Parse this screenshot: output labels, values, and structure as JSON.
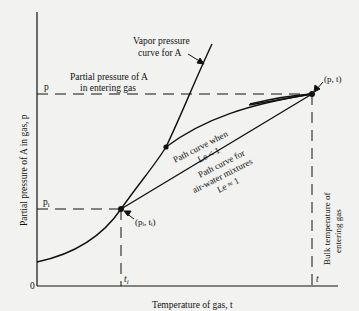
{
  "diagram": {
    "axes": {
      "x_label": "Temperature of gas, t",
      "y_label": "Partial pressure of A in gas, p",
      "origin_label": "0",
      "x_ticks": [
        {
          "label": "t",
          "sub": "i",
          "x": 121
        },
        {
          "label": "t",
          "sub": "",
          "x": 312
        }
      ],
      "y_ticks": [
        {
          "label": "p",
          "sub": "",
          "y": 94
        },
        {
          "label": "p",
          "sub": "i",
          "y": 209
        }
      ]
    },
    "labels": {
      "vapor_curve_line1": "Vapor pressure",
      "vapor_curve_line2": "curve for A",
      "partial_pressure_line1": "Partial pressure of A",
      "partial_pressure_line2": "in entering gas",
      "path_le_lt1_line1": "Path curve when",
      "path_le_lt1_line2": "Le < 1",
      "path_airwater_line1": "Path curve for",
      "path_airwater_line2": "air-water mixtures",
      "path_airwater_line3": "Le ≈ 1",
      "bulk_temp_line1": "Bulk temperature of",
      "bulk_temp_line2": "entering gas",
      "point_entering": "(p, t)",
      "point_interface": "(pᵢ, tᵢ)"
    },
    "points": {
      "entering_gas": {
        "x": 312,
        "y": 94
      },
      "interface": {
        "x": 121,
        "y": 209
      },
      "le_intersection": {
        "x": 166,
        "y": 147
      }
    },
    "colors": {
      "background": "#f2f2f0",
      "ink": "#111111"
    }
  }
}
